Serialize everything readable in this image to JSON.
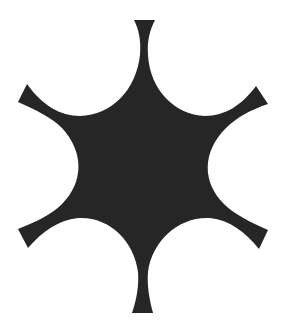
{
  "figure": {
    "shape": "six-pointed-concave-star-icon",
    "fill_color": "#262626",
    "background_color": "#ffffff",
    "points": 6
  }
}
